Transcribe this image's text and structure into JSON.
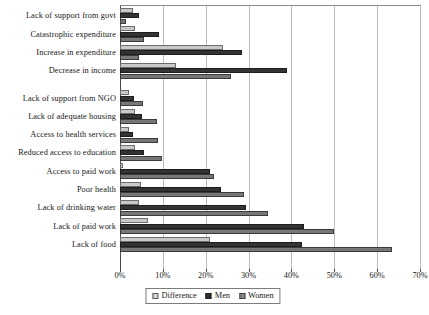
{
  "chart_data": {
    "type": "bar",
    "orientation": "horizontal",
    "title": "",
    "subtitle": "",
    "xlabel": "",
    "ylabel": "",
    "xlim": [
      0,
      70
    ],
    "xtick_labels": [
      "0%",
      "10%",
      "20%",
      "30%",
      "40%",
      "50%",
      "60%",
      "70%"
    ],
    "xticks": [
      0,
      10,
      20,
      30,
      40,
      50,
      60,
      70
    ],
    "grid": true,
    "legend_position": "bottom-center",
    "series_order": [
      "Difference",
      "Men",
      "Women"
    ],
    "categories": [
      "Lack of support from govt",
      "Catastrophic expenditure",
      "Increase in expenditure",
      "Decrease in income",
      "Lack of support from NGO",
      "Lack of adequate housing",
      "Access to health services",
      "Reduced access to education",
      "Access to paid work",
      "Poor health",
      "Lack of drinking water",
      "Lack of paid work",
      "Lack of food"
    ],
    "series": [
      {
        "name": "Difference",
        "color": "#c9c9c9",
        "values": [
          3.0,
          3.4,
          24.0,
          13.0,
          2.0,
          3.4,
          2.2,
          3.4,
          0.7,
          5.0,
          4.5,
          6.5,
          21.0
        ]
      },
      {
        "name": "Men",
        "color": "#333333",
        "values": [
          4.5,
          9.0,
          28.5,
          39.0,
          3.3,
          5.2,
          3.0,
          5.5,
          21.0,
          23.5,
          29.5,
          43.0,
          42.5
        ]
      },
      {
        "name": "Women",
        "color": "#777777",
        "values": [
          1.5,
          5.6,
          4.5,
          26.0,
          5.3,
          8.6,
          8.8,
          9.8,
          22.0,
          29.0,
          34.5,
          50.0,
          63.5
        ]
      }
    ],
    "group_break_after_category": "Decrease in income"
  },
  "legend": {
    "items": [
      {
        "label": "Difference",
        "swatch": "light-gray-square"
      },
      {
        "label": "Men",
        "swatch": "dark-square"
      },
      {
        "label": "Women",
        "swatch": "mid-gray-square"
      }
    ]
  }
}
